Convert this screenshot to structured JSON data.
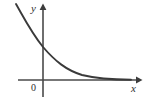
{
  "figure": {
    "title": "",
    "caption": "",
    "background_color": "#ffffff",
    "width": 146,
    "height": 104
  },
  "axes": {
    "x_label": "x",
    "y_label": "y",
    "origin_label": "0",
    "stroke_color": "#4a4a4a",
    "x_axis_pixel_y": 80,
    "y_axis_pixel_x": 43,
    "x_axis_start_px": 18,
    "x_axis_end_px": 139,
    "y_axis_top_px": 6,
    "y_axis_bottom_px": 97,
    "arrow_x": "right",
    "arrow_y": "up"
  },
  "curve": {
    "name": "decaying-exponential",
    "stroke_color": "#3a3a3a",
    "stroke_width": 1.9,
    "path": "M 16 4 C 24 18, 31 32, 43 47 C 55 61, 66 70, 82 75 C 98 78.8, 114 79.6, 131 79.8"
  },
  "chart_data": {
    "type": "line",
    "title": "",
    "xlabel": "x",
    "ylabel": "y",
    "grid": false,
    "legend": "none",
    "annotations": [
      "0"
    ],
    "xlim": [
      -1.1,
      4.0
    ],
    "ylim": [
      0,
      3.4
    ],
    "series": [
      {
        "name": "y = a^x (0 < a < 1)",
        "x": [
          -1.1,
          -0.8,
          -0.5,
          -0.2,
          0.0,
          0.3,
          0.6,
          1.0,
          1.4,
          1.8,
          2.3,
          2.8,
          3.3,
          3.8
        ],
        "y": [
          3.3,
          2.75,
          2.25,
          1.75,
          1.45,
          1.1,
          0.85,
          0.58,
          0.4,
          0.28,
          0.18,
          0.11,
          0.07,
          0.05
        ]
      }
    ]
  }
}
